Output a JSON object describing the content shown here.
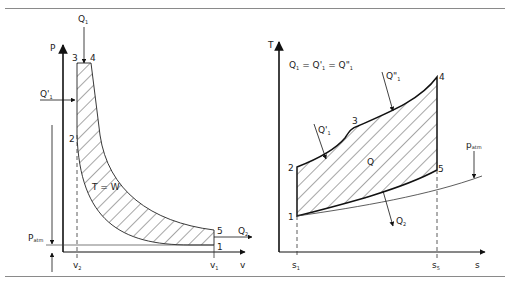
{
  "figure": {
    "left_panel": {
      "name": "P-v diagram",
      "y_axis_label": "P",
      "x_axis_label": "v",
      "points": [
        "1",
        "2",
        "3",
        "4",
        "5"
      ],
      "x_ticks": [
        {
          "main": "v",
          "sub": "2"
        },
        {
          "main": "v",
          "sub": "1"
        }
      ],
      "heat_in_top": {
        "main": "Q",
        "sub": "1"
      },
      "heat_in_side": {
        "main": "Q'",
        "sub": "1"
      },
      "heat_out": {
        "main": "Q",
        "sub": "2"
      },
      "atm_pressure": {
        "main": "P",
        "sub": "atm"
      },
      "area_label": "T = W"
    },
    "right_panel": {
      "name": "T-s diagram",
      "y_axis_label": "T",
      "x_axis_label": "s",
      "points": [
        "1",
        "2",
        "3",
        "4",
        "5"
      ],
      "x_ticks": [
        {
          "main": "s",
          "sub": "1"
        },
        {
          "main": "s",
          "sub": "5"
        }
      ],
      "equation": {
        "q1": "Q",
        "q1_sub": "1",
        "eq": " = ",
        "q1p": "Q'",
        "q1p_sub": "1",
        "eq2": " = ",
        "q1pp": "Q\"",
        "q1pp_sub": "1"
      },
      "heat_in_1": {
        "main": "Q'",
        "sub": "1"
      },
      "heat_in_2": {
        "main": "Q\"",
        "sub": "1"
      },
      "heat_out": {
        "main": "Q",
        "sub": "2"
      },
      "area_label": "Q",
      "atm_pressure": {
        "main": "p",
        "sub": "atm"
      }
    }
  }
}
